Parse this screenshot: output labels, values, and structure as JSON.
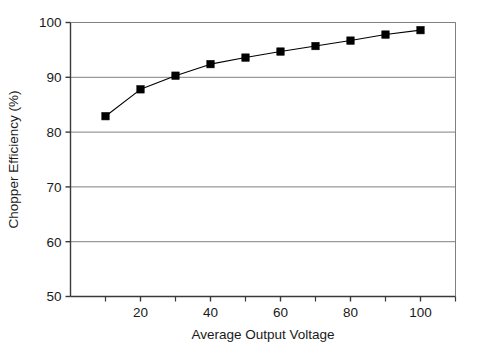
{
  "chart_data": {
    "type": "line",
    "title": "",
    "subtitle": "",
    "xlabel": "Average Output Voltage",
    "ylabel": "Chopper Efficiency (%)",
    "xlim": [
      0,
      110
    ],
    "ylim": [
      50,
      100
    ],
    "xticks": [
      20,
      40,
      60,
      80,
      100
    ],
    "xtick_labels": [
      "20",
      "40",
      "60",
      "80",
      "100"
    ],
    "xminorticks": [
      10,
      30,
      50,
      70,
      90,
      110
    ],
    "yticks": [
      50,
      60,
      70,
      80,
      90,
      100
    ],
    "ytick_labels": [
      "50",
      "60",
      "70",
      "80",
      "90",
      "100"
    ],
    "grid": "horizontal",
    "legend": "none",
    "marker": "square",
    "line_color": "#000000",
    "marker_color": "#000000",
    "grid_color": "#808080",
    "axis_color": "#555555",
    "background": "#ffffff",
    "x": [
      10,
      20,
      30,
      40,
      50,
      60,
      70,
      80,
      90,
      100
    ],
    "values": [
      82.9,
      87.8,
      90.3,
      92.4,
      93.6,
      94.7,
      95.7,
      96.7,
      97.8,
      98.6
    ],
    "series": [
      {
        "name": "Chopper Efficiency",
        "values": [
          82.9,
          87.8,
          90.3,
          92.4,
          93.6,
          94.7,
          95.7,
          96.7,
          97.8,
          98.6
        ]
      }
    ]
  }
}
